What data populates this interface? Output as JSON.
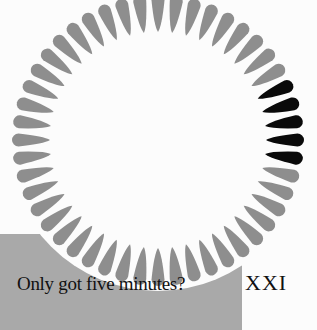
{
  "page": {
    "caption": "Only got five minutes?",
    "chapter_number": "XXI"
  },
  "illustration": {
    "type": "clock-dial-of-petals",
    "petal_count": 48,
    "highlighted_petals": 5,
    "colors": {
      "petal": "#8e8e8e",
      "highlight": "#0a0a0a",
      "block": "#a9a9a9",
      "background": "#fcfcfc"
    }
  }
}
